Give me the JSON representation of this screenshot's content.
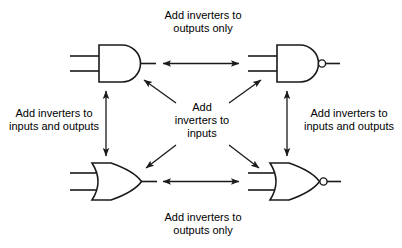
{
  "diagram": {
    "background_color": "#ffffff",
    "stroke_color": "#1a1a1a",
    "labels": {
      "top": "Add inverters to\noutputs only",
      "bottom": "Add inverters to\noutputs only",
      "left": "Add inverters to\ninputs and outputs",
      "right": "Add inverters to\ninputs and outputs",
      "center": "Add\ninverters to\ninputs"
    },
    "gates": [
      {
        "id": "and-gate",
        "name": "AND gate",
        "position": "top-left",
        "shape": "and",
        "inverted_output": false,
        "inputs": 2
      },
      {
        "id": "nand-gate",
        "name": "NAND gate",
        "position": "top-right",
        "shape": "and",
        "inverted_output": true,
        "inputs": 2
      },
      {
        "id": "or-gate",
        "name": "OR gate",
        "position": "bottom-left",
        "shape": "or",
        "inverted_output": false,
        "inputs": 2
      },
      {
        "id": "nor-gate",
        "name": "NOR gate",
        "position": "bottom-right",
        "shape": "or",
        "inverted_output": true,
        "inputs": 2
      }
    ],
    "connectors": [
      {
        "id": "and-nand",
        "from": "and-gate",
        "to": "nand-gate",
        "orientation": "horizontal",
        "heads": "both",
        "label": "top"
      },
      {
        "id": "or-nor",
        "from": "or-gate",
        "to": "nor-gate",
        "orientation": "horizontal",
        "heads": "both",
        "label": "bottom"
      },
      {
        "id": "and-or",
        "from": "and-gate",
        "to": "or-gate",
        "orientation": "vertical",
        "heads": "both",
        "label": "left"
      },
      {
        "id": "nand-nor",
        "from": "nand-gate",
        "to": "nor-gate",
        "orientation": "vertical",
        "heads": "both",
        "label": "right"
      },
      {
        "id": "center-and",
        "from": "center",
        "to": "and-gate",
        "orientation": "diagonal-up-left",
        "heads": "end",
        "label": "center"
      },
      {
        "id": "center-nand",
        "from": "center",
        "to": "nand-gate",
        "orientation": "diagonal-up-right",
        "heads": "end",
        "label": "center"
      },
      {
        "id": "center-or",
        "from": "center",
        "to": "or-gate",
        "orientation": "diagonal-down-left",
        "heads": "end",
        "label": "center"
      },
      {
        "id": "center-nor",
        "from": "center",
        "to": "nor-gate",
        "orientation": "diagonal-down-right",
        "heads": "end",
        "label": "center"
      }
    ]
  }
}
